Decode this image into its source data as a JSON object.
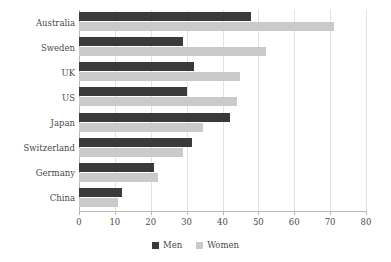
{
  "chart_data": {
    "type": "bar",
    "orientation": "horizontal",
    "title": "",
    "subtitle": "",
    "xlabel": "",
    "ylabel": "",
    "xlim": [
      0,
      80
    ],
    "xticks": [
      0,
      10,
      20,
      30,
      40,
      50,
      60,
      70,
      80
    ],
    "grid": true,
    "legend_position": "bottom",
    "categories": [
      "Australia",
      "Sweden",
      "UK",
      "US",
      "Japan",
      "Switzerland",
      "Germany",
      "China"
    ],
    "series": [
      {
        "name": "Men",
        "color": "#3a3a3a",
        "values": [
          48,
          29,
          32,
          30,
          42,
          31.5,
          21,
          12
        ]
      },
      {
        "name": "Women",
        "color": "#cacaca",
        "values": [
          71,
          52,
          45,
          44,
          34.5,
          29,
          22,
          11
        ]
      }
    ]
  },
  "axis": {
    "tick_labels": [
      "0",
      "10",
      "20",
      "30",
      "40",
      "50",
      "60",
      "70",
      "80"
    ]
  },
  "legend": {
    "items": [
      {
        "label": "Men",
        "swatch": "men-swatch-icon"
      },
      {
        "label": "Women",
        "swatch": "women-swatch-icon"
      }
    ]
  },
  "colors": {
    "men": "#3a3a3a",
    "women": "#cacaca",
    "grid": "#e2e2e2",
    "axis": "#b8b8b8",
    "text": "#4a4a4a",
    "background": "#ffffff"
  }
}
